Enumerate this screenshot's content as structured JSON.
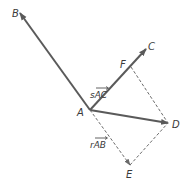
{
  "diagram": {
    "points": {
      "A": {
        "label": "A",
        "x": 90,
        "y": 110
      },
      "B": {
        "label": "B",
        "x": 20,
        "y": 13
      },
      "C": {
        "label": "C",
        "x": 146,
        "y": 49
      },
      "D": {
        "label": "D",
        "x": 168,
        "y": 123
      },
      "E": {
        "label": "E",
        "x": 130,
        "y": 165
      },
      "F": {
        "label": "F",
        "x": 131,
        "y": 67
      }
    },
    "vector_labels": {
      "sAC": {
        "scalar": "s",
        "vector": "AC"
      },
      "rAB": {
        "scalar": "r",
        "vector": "AB"
      }
    },
    "colors": {
      "solid": "#5a5a5a",
      "dashed": "#6a6a6a",
      "text": "#3a3a3a"
    }
  }
}
